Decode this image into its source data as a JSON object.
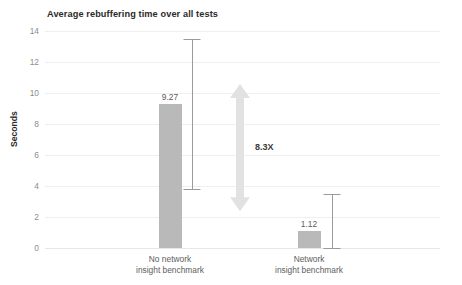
{
  "chart_data": {
    "type": "bar",
    "title": "Average rebuffering time over all tests",
    "xlabel": "",
    "ylabel": "Seconds",
    "ylim": [
      0,
      14
    ],
    "yticks": [
      0,
      2,
      4,
      6,
      8,
      10,
      12,
      14
    ],
    "ytick_labels": [
      "0",
      "2",
      "4",
      "6",
      "8",
      "10",
      "12",
      "14"
    ],
    "grid": true,
    "legend": "none",
    "categories": [
      "No network\ninsight benchmark",
      "Network\ninsight benchmark"
    ],
    "values": [
      9.27,
      1.12
    ],
    "value_labels": [
      "9.27",
      "1.12"
    ],
    "error_bars": [
      {
        "low": 3.8,
        "high": 13.5
      },
      {
        "low": 0.0,
        "high": 3.5
      }
    ],
    "annotations": [
      {
        "label": "8.3X",
        "kind": "double-arrow",
        "from": 1.12,
        "to": 9.27
      }
    ],
    "colors": {
      "bar": "#b9b9b9",
      "error_bar": "#9a9a9a",
      "grid": "#efefef",
      "arrow": "#e2e2e2",
      "title_text": "#2b2b2b",
      "tick_text": "#8d8d8d",
      "label_text": "#5d5d5d",
      "background": "#ffffff"
    }
  }
}
